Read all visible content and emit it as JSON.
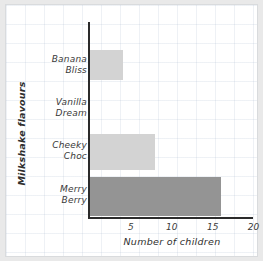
{
  "chart_data": {
    "type": "bar",
    "orientation": "horizontal",
    "title": "",
    "xlabel": "Number of children",
    "ylabel": "Milkshake flavours",
    "categories": [
      "Banana Bliss",
      "Vanilla Dream",
      "Cheeky Choc",
      "Merry Berry"
    ],
    "category_lines": [
      [
        "Banana",
        "Bliss"
      ],
      [
        "Vanilla",
        "Dream"
      ],
      [
        "Cheeky",
        "Choc"
      ],
      [
        "Merry",
        "Berry"
      ]
    ],
    "values": [
      4,
      0,
      8,
      16
    ],
    "bar_colors": [
      "#d3d3d3",
      "#d3d3d3",
      "#d3d3d3",
      "#949494"
    ],
    "xlim": [
      0,
      20
    ],
    "xticks": [
      5,
      10,
      15,
      20
    ],
    "xtick_labels": [
      "5",
      "10",
      "15",
      "20"
    ],
    "grid": true,
    "legend": null
  },
  "style": {
    "page_background": "#e9e9e9",
    "paper_background": "#ffffff",
    "grid_color": "#c2cede",
    "axis_color": "#2b2b2b",
    "text_color": "#3a3a3a"
  }
}
